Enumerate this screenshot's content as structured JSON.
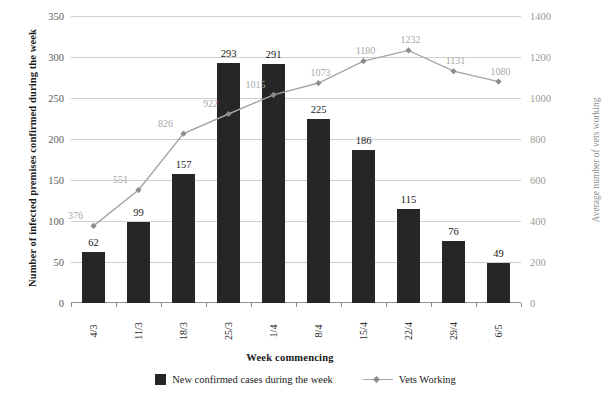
{
  "chart_data": {
    "type": "bar",
    "title": "",
    "subtitle": "",
    "xlabel": "Week commencing",
    "ylabel": "Number of infected premises confirmed during the week",
    "y2label": "Average number of vets working",
    "categories": [
      "4/3",
      "11/3",
      "18/3",
      "25/3",
      "1/4",
      "8/4",
      "15/4",
      "22/4",
      "29/4",
      "6/5"
    ],
    "ylim": [
      0,
      350
    ],
    "y2lim": [
      0,
      1400
    ],
    "yticks": [
      0,
      50,
      100,
      150,
      200,
      250,
      300,
      350
    ],
    "y2ticks": [
      0,
      200,
      400,
      600,
      800,
      1000,
      1200,
      1400
    ],
    "grid": true,
    "legend_position": "bottom",
    "series": [
      {
        "name": "New confirmed cases during the week",
        "type": "bar",
        "axis": "left",
        "color": "#262626",
        "values": [
          62,
          99,
          157,
          293,
          291,
          225,
          186,
          115,
          76,
          49
        ]
      },
      {
        "name": "Vets Working",
        "type": "line",
        "axis": "right",
        "color": "#a5a5a5",
        "marker": "diamond",
        "values": [
          376,
          551,
          826,
          922,
          1015,
          1073,
          1180,
          1232,
          1131,
          1080
        ]
      }
    ]
  },
  "legend": {
    "items": [
      {
        "label": "New confirmed cases during the week",
        "marker": "filled-square-icon"
      },
      {
        "label": "Vets Working",
        "marker": "line-diamond-icon"
      }
    ]
  }
}
